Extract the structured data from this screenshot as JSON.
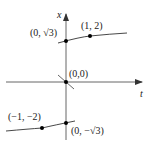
{
  "diagram": {
    "axes": {
      "horizontal_label": "t",
      "vertical_label": "x"
    },
    "points": [
      {
        "id": "p1",
        "label": "(1, 2)"
      },
      {
        "id": "p2",
        "label": "(0, √3)"
      },
      {
        "id": "p3",
        "label": "(0,0)"
      },
      {
        "id": "p4",
        "label": "(−1, −2)"
      },
      {
        "id": "p5",
        "label": "(0, −√3)"
      }
    ],
    "colors": {
      "curve": "#333333",
      "axis": "#444444",
      "point": "#111111"
    }
  }
}
